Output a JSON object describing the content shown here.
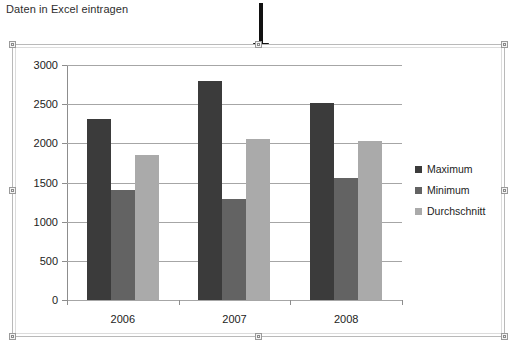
{
  "caption": "Daten in Excel eintragen",
  "annotation": {
    "arrow": "down-arrow",
    "color": "#111111"
  },
  "chart_object": {
    "selected": true,
    "handles": [
      "top-left",
      "top-middle",
      "top-right",
      "middle-left",
      "middle-right",
      "bottom-left",
      "bottom-middle",
      "bottom-right"
    ]
  },
  "chart_data": {
    "type": "bar",
    "title": "",
    "xlabel": "",
    "ylabel": "",
    "categories": [
      "2006",
      "2007",
      "2008"
    ],
    "series": [
      {
        "name": "Maximum",
        "color": "#3b3b3b",
        "values": [
          2310,
          2790,
          2510
        ]
      },
      {
        "name": "Minimum",
        "color": "#636363",
        "values": [
          1400,
          1290,
          1560
        ]
      },
      {
        "name": "Durchschnitt",
        "color": "#aaaaaa",
        "values": [
          1850,
          2050,
          2030
        ]
      }
    ],
    "ylim": [
      0,
      3000
    ],
    "yticks": [
      0,
      500,
      1000,
      1500,
      2000,
      2500,
      3000
    ],
    "ytick_labels": [
      "0",
      "500",
      "1000",
      "1500",
      "2000",
      "2500",
      "3000"
    ],
    "grid": true,
    "grid_axis": "y",
    "legend": [
      "Maximum",
      "Minimum",
      "Durchschnitt"
    ],
    "legend_position": "right"
  }
}
